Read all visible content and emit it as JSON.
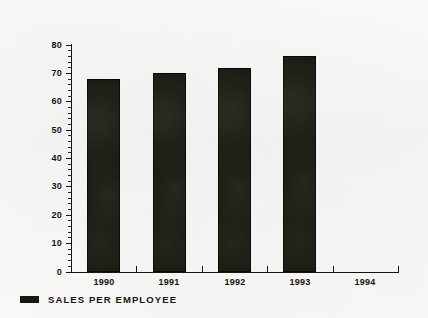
{
  "chart_data": {
    "type": "bar",
    "title": "",
    "subtitle": "",
    "xlabel": "",
    "ylabel": "",
    "categories": [
      "1990",
      "1991",
      "1992",
      "1993",
      "1994"
    ],
    "series": [
      {
        "name": "SALES PER EMPLOYEE",
        "color": "#17170f",
        "values": [
          68,
          70,
          72,
          76,
          null
        ]
      }
    ],
    "ylim": [
      0,
      80
    ],
    "y_ticks": [
      0,
      10,
      20,
      30,
      40,
      50,
      60,
      70,
      80
    ],
    "y_tick_labels": [
      "0",
      "10",
      "20",
      "30",
      "40",
      "50",
      "60",
      "70",
      "80"
    ],
    "y_minor_tick_step": 2,
    "grid": false,
    "legend": {
      "position": "bottom-left",
      "entries": [
        {
          "label": "SALES PER EMPLOYEE",
          "swatch_color": "#17170f"
        }
      ]
    }
  },
  "figure": {
    "background_color": "#f8f8f6",
    "axis_color": "#15150f",
    "text_color": "#16160f"
  }
}
